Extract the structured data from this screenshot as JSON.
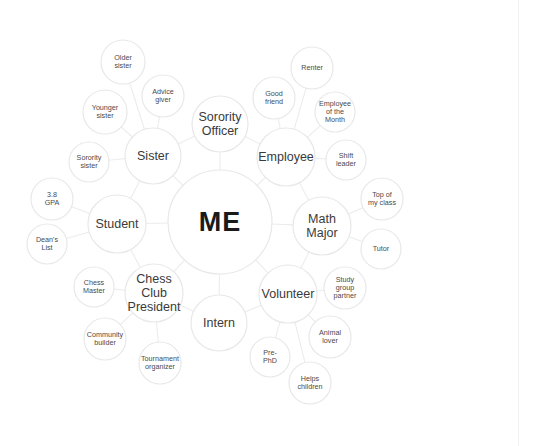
{
  "diagram": {
    "title": "ME",
    "type": "mind-map",
    "background_color": "#ffffff",
    "circle_stroke_color": "#e8e8ea",
    "link_stroke_color": "#ececee",
    "center": {
      "id": "me",
      "label": "ME",
      "cx": 220,
      "cy": 222,
      "r": 52,
      "level": "center"
    },
    "hubs": [
      {
        "id": "sister",
        "label": "Sister",
        "cx": 153,
        "cy": 156,
        "r": 28,
        "level": "hub"
      },
      {
        "id": "sorority-officer",
        "label": "Sorority\nOfficer",
        "cx": 220,
        "cy": 124,
        "r": 28,
        "level": "hub"
      },
      {
        "id": "employee",
        "label": "Employee",
        "cx": 286,
        "cy": 157,
        "r": 29,
        "level": "hub"
      },
      {
        "id": "math-major",
        "label": "Math\nMajor",
        "cx": 322,
        "cy": 226,
        "r": 29,
        "level": "hub"
      },
      {
        "id": "volunteer",
        "label": "Volunteer",
        "cx": 288,
        "cy": 294,
        "r": 29,
        "level": "hub"
      },
      {
        "id": "intern",
        "label": "Intern",
        "cx": 219,
        "cy": 323,
        "r": 28,
        "level": "hub"
      },
      {
        "id": "chess-club-president",
        "label": "Chess\nClub\nPresident",
        "cx": 154,
        "cy": 293,
        "r": 29,
        "level": "hub"
      },
      {
        "id": "student",
        "label": "Student",
        "cx": 117,
        "cy": 224,
        "r": 29,
        "level": "hub"
      }
    ],
    "leaves": [
      {
        "id": "older-sister",
        "label": "Older\nsister",
        "cx": 123,
        "cy": 62,
        "r": 22,
        "parent": "sister"
      },
      {
        "id": "younger-sister",
        "label": "Younger\nsister",
        "cx": 105,
        "cy": 112,
        "r": 22,
        "parent": "sister"
      },
      {
        "id": "sorority-sister",
        "label": "Sorority\nsister",
        "cx": 89,
        "cy": 162,
        "r": 20,
        "parent": "sister"
      },
      {
        "id": "advice-giver",
        "label": "Advice\ngiver",
        "cx": 163,
        "cy": 96,
        "r": 21,
        "parent": "sister"
      },
      {
        "id": "renter",
        "label": "Renter",
        "cx": 312,
        "cy": 68,
        "r": 21,
        "parent": "employee"
      },
      {
        "id": "good-friend",
        "label": "Good\nfriend",
        "cx": 274,
        "cy": 98,
        "r": 21,
        "parent": "employee"
      },
      {
        "id": "employee-of-month",
        "label": "Employee\nof the\nMonth",
        "cx": 335,
        "cy": 112,
        "r": 20,
        "parent": "employee"
      },
      {
        "id": "shift-leader",
        "label": "Shift\nleader",
        "cx": 346,
        "cy": 160,
        "r": 20,
        "parent": "employee"
      },
      {
        "id": "top-of-my-class",
        "label": "Top of\nmy class",
        "cx": 382,
        "cy": 199,
        "r": 21,
        "parent": "math-major"
      },
      {
        "id": "tutor",
        "label": "Tutor",
        "cx": 381,
        "cy": 249,
        "r": 20,
        "parent": "math-major"
      },
      {
        "id": "study-group-partner",
        "label": "Study\ngroup\npartner",
        "cx": 345,
        "cy": 288,
        "r": 21,
        "parent": "volunteer"
      },
      {
        "id": "animal-lover",
        "label": "Animal\nlover",
        "cx": 330,
        "cy": 337,
        "r": 21,
        "parent": "volunteer"
      },
      {
        "id": "helps-children",
        "label": "Helps\nchildren",
        "cx": 310,
        "cy": 383,
        "r": 21,
        "parent": "volunteer"
      },
      {
        "id": "pre-phd",
        "label": "Pre-\nPhD",
        "cx": 270,
        "cy": 357,
        "r": 20,
        "parent": "volunteer"
      },
      {
        "id": "tournament-organizer",
        "label": "Tournament\norganizer",
        "cx": 160,
        "cy": 363,
        "r": 21,
        "parent": "chess-club-president"
      },
      {
        "id": "community-builder",
        "label": "Community\nbuilder",
        "cx": 105,
        "cy": 339,
        "r": 21,
        "parent": "chess-club-president"
      },
      {
        "id": "chess-master",
        "label": "Chess\nMaster",
        "cx": 94,
        "cy": 287,
        "r": 20,
        "parent": "chess-club-president"
      },
      {
        "id": "deans-list",
        "label": "Dean's\nList",
        "cx": 47,
        "cy": 244,
        "r": 20,
        "parent": "student"
      },
      {
        "id": "gpa",
        "label": "3.8\nGPA",
        "cx": 52,
        "cy": 199,
        "r": 21,
        "parent": "student"
      }
    ],
    "links": [
      {
        "from": "me",
        "to": "sister"
      },
      {
        "from": "me",
        "to": "sorority-officer"
      },
      {
        "from": "me",
        "to": "employee"
      },
      {
        "from": "me",
        "to": "math-major"
      },
      {
        "from": "me",
        "to": "volunteer"
      },
      {
        "from": "me",
        "to": "intern"
      },
      {
        "from": "me",
        "to": "chess-club-president"
      },
      {
        "from": "me",
        "to": "student"
      },
      {
        "from": "sister",
        "to": "older-sister"
      },
      {
        "from": "sister",
        "to": "younger-sister"
      },
      {
        "from": "sister",
        "to": "sorority-sister"
      },
      {
        "from": "sister",
        "to": "advice-giver"
      },
      {
        "from": "employee",
        "to": "renter"
      },
      {
        "from": "employee",
        "to": "good-friend"
      },
      {
        "from": "employee",
        "to": "employee-of-month"
      },
      {
        "from": "employee",
        "to": "shift-leader"
      },
      {
        "from": "math-major",
        "to": "top-of-my-class"
      },
      {
        "from": "math-major",
        "to": "tutor"
      },
      {
        "from": "volunteer",
        "to": "study-group-partner"
      },
      {
        "from": "volunteer",
        "to": "animal-lover"
      },
      {
        "from": "volunteer",
        "to": "helps-children"
      },
      {
        "from": "volunteer",
        "to": "pre-phd"
      },
      {
        "from": "chess-club-president",
        "to": "tournament-organizer"
      },
      {
        "from": "chess-club-president",
        "to": "community-builder"
      },
      {
        "from": "chess-club-president",
        "to": "chess-master"
      },
      {
        "from": "student",
        "to": "deans-list"
      },
      {
        "from": "student",
        "to": "gpa"
      },
      {
        "from": "sister",
        "to": "student"
      },
      {
        "from": "sister",
        "to": "sorority-officer"
      },
      {
        "from": "sorority-officer",
        "to": "employee"
      },
      {
        "from": "employee",
        "to": "math-major"
      },
      {
        "from": "math-major",
        "to": "volunteer"
      },
      {
        "from": "volunteer",
        "to": "intern"
      },
      {
        "from": "intern",
        "to": "chess-club-president"
      },
      {
        "from": "chess-club-president",
        "to": "student"
      }
    ]
  }
}
